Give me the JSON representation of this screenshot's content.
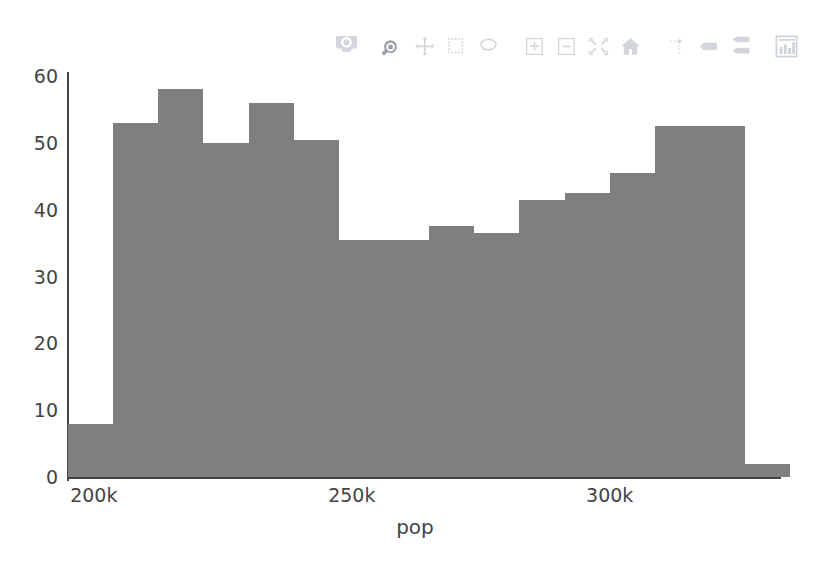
{
  "chart_data": {
    "type": "bar",
    "title": "",
    "subtitle": "",
    "xlabel": "pop",
    "ylabel": "",
    "grid": false,
    "legend": null,
    "bar_color": "#7f7f7f",
    "background_color": "#ffffff",
    "axis_color": "#444444",
    "xlim": [
      195000,
      333000
    ],
    "ylim": [
      0,
      62
    ],
    "ytick_values": [
      0,
      10,
      20,
      30,
      40,
      50,
      60
    ],
    "ytick_labels": [
      "0",
      "10",
      "20",
      "30",
      "40",
      "50",
      "60"
    ],
    "xtick_values": [
      200000,
      250000,
      300000
    ],
    "xtick_labels": [
      "200k",
      "250k",
      "300k"
    ],
    "bin_width": 8750,
    "bin_starts": [
      195000,
      203750,
      212500,
      221250,
      230000,
      238750,
      247500,
      256250,
      265000,
      273750,
      282500,
      291250,
      300000,
      308750,
      317500,
      326250
    ],
    "categories": [
      "195.0k",
      "203.8k",
      "212.5k",
      "221.3k",
      "230.0k",
      "238.8k",
      "247.5k",
      "256.3k",
      "265.0k",
      "273.8k",
      "282.5k",
      "291.3k",
      "300.0k",
      "308.8k",
      "317.5k",
      "326.3k"
    ],
    "values": [
      8,
      53,
      58,
      50,
      56,
      50.5,
      35.5,
      35.5,
      37.5,
      36.5,
      41.5,
      42.5,
      45.5,
      52.5,
      52.5,
      2
    ]
  },
  "modebar": {
    "buttons": [
      {
        "name": "download-plot-icon",
        "label": "Download plot as a png",
        "active": false
      },
      {
        "name": "zoom-icon",
        "label": "Zoom",
        "active": true
      },
      {
        "name": "pan-icon",
        "label": "Pan",
        "active": false
      },
      {
        "name": "box-select-icon",
        "label": "Box Select",
        "active": false
      },
      {
        "name": "lasso-select-icon",
        "label": "Lasso Select",
        "active": false
      },
      {
        "name": "zoom-in-icon",
        "label": "Zoom in",
        "active": false
      },
      {
        "name": "zoom-out-icon",
        "label": "Zoom out",
        "active": false
      },
      {
        "name": "autoscale-icon",
        "label": "Autoscale",
        "active": false
      },
      {
        "name": "reset-axes-icon",
        "label": "Reset axes",
        "active": false
      },
      {
        "name": "toggle-spike-lines-icon",
        "label": "Toggle Spike Lines",
        "active": false
      },
      {
        "name": "hover-closest-icon",
        "label": "Show closest data on hover",
        "active": false
      },
      {
        "name": "hover-compare-icon",
        "label": "Compare data on hover",
        "active": false
      },
      {
        "name": "plotly-logo-icon",
        "label": "Produced with Plotly",
        "active": false
      }
    ]
  }
}
